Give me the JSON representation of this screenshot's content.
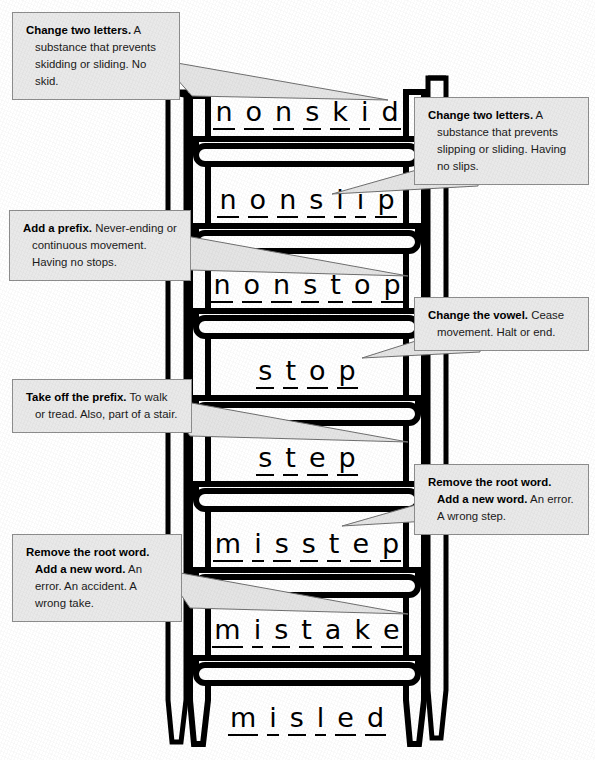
{
  "ladder": {
    "rungs": [
      {
        "word": "nonskid",
        "letters": [
          "n",
          "o",
          "n",
          "s",
          "k",
          "i",
          "d"
        ]
      },
      {
        "word": "nonslip",
        "letters": [
          "n",
          "o",
          "n",
          "s",
          "l",
          "i",
          "p"
        ]
      },
      {
        "word": "nonstop",
        "letters": [
          "n",
          "o",
          "n",
          "s",
          "t",
          "o",
          "p"
        ]
      },
      {
        "word": "stop",
        "letters": [
          "s",
          "t",
          "o",
          "p"
        ]
      },
      {
        "word": "step",
        "letters": [
          "s",
          "t",
          "e",
          "p"
        ]
      },
      {
        "word": "misstep",
        "letters": [
          "m",
          "i",
          "s",
          "s",
          "t",
          "e",
          "p"
        ]
      },
      {
        "word": "mistake",
        "letters": [
          "m",
          "i",
          "s",
          "t",
          "a",
          "k",
          "e"
        ]
      },
      {
        "word": "misled",
        "letters": [
          "m",
          "i",
          "s",
          "l",
          "e",
          "d"
        ]
      }
    ]
  },
  "callouts": [
    {
      "id": "callout-nonskid",
      "side": "left",
      "target_word": "nonskid",
      "instruction": "Change two letters.",
      "definition": "A substance that prevents skidding or sliding. No skid."
    },
    {
      "id": "callout-nonslip",
      "side": "right",
      "target_word": "nonslip",
      "instruction": "Change two letters.",
      "definition": "A substance that prevents slipping or sliding. Having no slips."
    },
    {
      "id": "callout-nonstop",
      "side": "left",
      "target_word": "nonstop",
      "instruction": "Add a prefix.",
      "definition": "Never-ending or continuous movement. Having no stops."
    },
    {
      "id": "callout-stop",
      "side": "right",
      "target_word": "stop",
      "instruction": "Change the vowel.",
      "definition": "Cease movement. Halt or end."
    },
    {
      "id": "callout-step",
      "side": "left",
      "target_word": "step",
      "instruction": "Take off the prefix.",
      "definition": "To walk or tread. Also, part of a stair."
    },
    {
      "id": "callout-misstep",
      "side": "right",
      "target_word": "misstep",
      "instruction": "Remove the root word. Add a new word.",
      "definition": "An error. A wrong step."
    },
    {
      "id": "callout-mistake",
      "side": "left",
      "target_word": "mistake",
      "instruction": "Remove the root word. Add a new word.",
      "definition": "An error. An accident. A wrong take."
    }
  ],
  "colors": {
    "callout_fill": "#e9e9e9",
    "callout_border": "#8d8d8d",
    "ladder_stroke": "#000000",
    "ladder_fill": "#ffffff",
    "text": "#1a1a1a"
  }
}
